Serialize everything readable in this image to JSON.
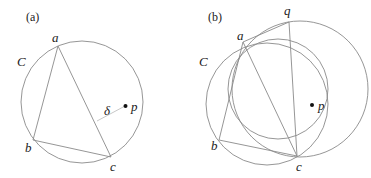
{
  "panels": [
    {
      "id": "a",
      "label": "(a)",
      "circle_label": "C",
      "points": {
        "a": "a",
        "b": "b",
        "c": "c",
        "p": "p"
      },
      "distance_label": "δ"
    },
    {
      "id": "b",
      "label": "(b)",
      "circle_label": "C",
      "points": {
        "a": "a",
        "b": "b",
        "c": "c",
        "p": "p",
        "q": "q"
      }
    }
  ]
}
